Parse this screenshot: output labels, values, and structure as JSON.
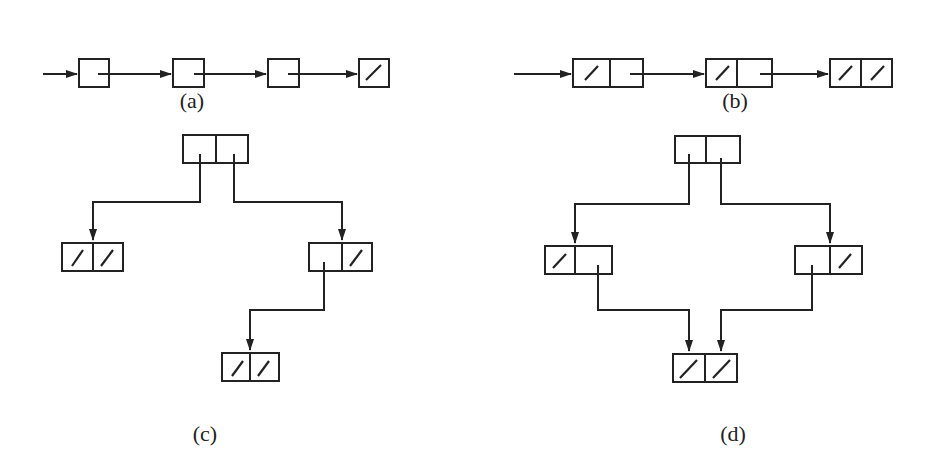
{
  "figure": {
    "panels": [
      {
        "id": "a",
        "caption": "(a)",
        "description": "singly linked list of 4 one-field nodes, last pointer nil"
      },
      {
        "id": "b",
        "caption": "(b)",
        "description": "linked list of 3 two-field nodes; left field nil in each, last node both nil"
      },
      {
        "id": "c",
        "caption": "(c)",
        "description": "binary tree: root with two children; right child has a left child; leaves have nil fields"
      },
      {
        "id": "d",
        "caption": "(d)",
        "description": "DAG: root with two children, both children point to a shared node with nil fields"
      }
    ],
    "colors": {
      "ink": "#222222",
      "background": "#ffffff"
    }
  }
}
